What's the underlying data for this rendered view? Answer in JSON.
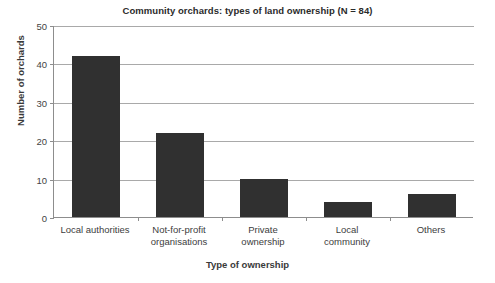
{
  "chart_data": {
    "type": "bar",
    "title": "Community orchards: types of land ownership (N = 84)",
    "xlabel": "Type of ownership",
    "ylabel": "Number of orchards",
    "categories": [
      "Local authorities",
      "Not-for-profit organisations",
      "Private ownership",
      "Local community",
      "Others"
    ],
    "category_lines": [
      [
        "Local authorities"
      ],
      [
        "Not-for-profit",
        "organisations"
      ],
      [
        "Private",
        "ownership"
      ],
      [
        "Local",
        "community"
      ],
      [
        "Others"
      ]
    ],
    "values": [
      42,
      22,
      10,
      4,
      6
    ],
    "ylim": [
      0,
      50
    ],
    "ytick_labels": [
      "0",
      "10",
      "20",
      "30",
      "40",
      "50"
    ],
    "ytick_values": [
      0,
      10,
      20,
      30,
      40,
      50
    ],
    "grid": true,
    "legend": false,
    "bar_color": "#303030",
    "axis_color": "#8d8d8d",
    "grid_color": "#a9a9a9",
    "text_color": "#3d3d3d",
    "total": 84
  }
}
